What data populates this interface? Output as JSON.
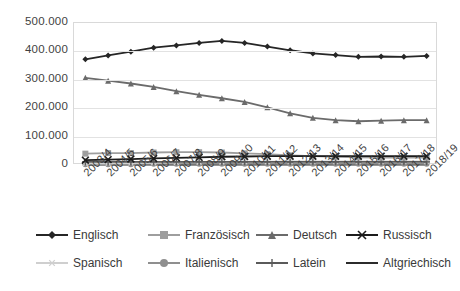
{
  "chart_data": {
    "type": "line",
    "title": "",
    "subtitle": "",
    "xlabel": "",
    "ylabel": "",
    "ylim": [
      0,
      500000
    ],
    "y_ticks": [
      "0",
      "100.000",
      "200.000",
      "300.000",
      "400.000",
      "500.000"
    ],
    "y_tick_values": [
      0,
      100000,
      200000,
      300000,
      400000,
      500000
    ],
    "grid": true,
    "legend_position": "bottom",
    "categories": [
      "2003/4",
      "2004/5",
      "2005/6",
      "2006/7",
      "2007/8",
      "2008/9",
      "2009/10",
      "2010/11",
      "2011/12",
      "2012/13",
      "2013/14",
      "2014/15",
      "2015/16",
      "2016/17",
      "2017/18",
      "2018/19"
    ],
    "series": [
      {
        "name": "Englisch",
        "marker": "diamond",
        "color": "#262626",
        "values": [
          372000,
          386000,
          399000,
          413000,
          421000,
          430000,
          437000,
          430000,
          417000,
          404000,
          393000,
          387000,
          381000,
          382000,
          381000,
          384000
        ]
      },
      {
        "name": "Französisch",
        "marker": "square",
        "color": "#9e9e9e",
        "values": [
          40000,
          42000,
          42000,
          44000,
          45000,
          45000,
          44000,
          41000,
          38000,
          34000,
          31000,
          29000,
          27000,
          26000,
          26000,
          26000
        ]
      },
      {
        "name": "Deutsch",
        "marker": "triangle",
        "color": "#6b6b6b",
        "values": [
          307000,
          297000,
          287000,
          275000,
          260000,
          247000,
          235000,
          222000,
          203000,
          182000,
          166000,
          158000,
          154000,
          156000,
          158000,
          158000
        ]
      },
      {
        "name": "Russisch",
        "marker": "cross",
        "color": "#1c1c1c",
        "values": [
          17000,
          19000,
          21000,
          23000,
          25000,
          27000,
          29000,
          30000,
          31000,
          31000,
          31000,
          31000,
          31000,
          31000,
          31000,
          31000
        ]
      },
      {
        "name": "Spanisch",
        "marker": "asterisk",
        "color": "#cfcfcf",
        "values": [
          5000,
          6000,
          7000,
          8000,
          9000,
          10000,
          11000,
          12000,
          12000,
          13000,
          13000,
          13000,
          13000,
          13000,
          13000,
          13000
        ]
      },
      {
        "name": "Italienisch",
        "marker": "circle",
        "color": "#8f8f8f",
        "values": [
          3000,
          3000,
          3000,
          4000,
          4000,
          4000,
          4000,
          4000,
          4000,
          4000,
          4000,
          4000,
          4000,
          4000,
          4000,
          4000
        ]
      },
      {
        "name": "Latein",
        "marker": "plus",
        "color": "#5a5a5a",
        "values": [
          11000,
          11000,
          11000,
          11000,
          11000,
          11000,
          11000,
          11000,
          11000,
          11000,
          11000,
          11000,
          11000,
          11000,
          11000,
          11000
        ]
      },
      {
        "name": "Altgriechisch",
        "marker": "none",
        "color": "#2b2b2b",
        "values": [
          1000,
          1000,
          1000,
          1000,
          1000,
          1000,
          1000,
          1000,
          1000,
          1000,
          1000,
          1000,
          1000,
          1000,
          1000,
          1000
        ]
      }
    ]
  }
}
